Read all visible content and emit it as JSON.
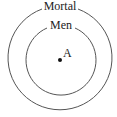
{
  "diagram": {
    "type": "euler-diagram",
    "sets": [
      {
        "label": "Mortal",
        "role": "outer"
      },
      {
        "label": "Men",
        "role": "inner"
      }
    ],
    "point": {
      "label": "A"
    },
    "colors": {
      "stroke": "#555555",
      "text": "#222222",
      "background": "#ffffff"
    }
  }
}
